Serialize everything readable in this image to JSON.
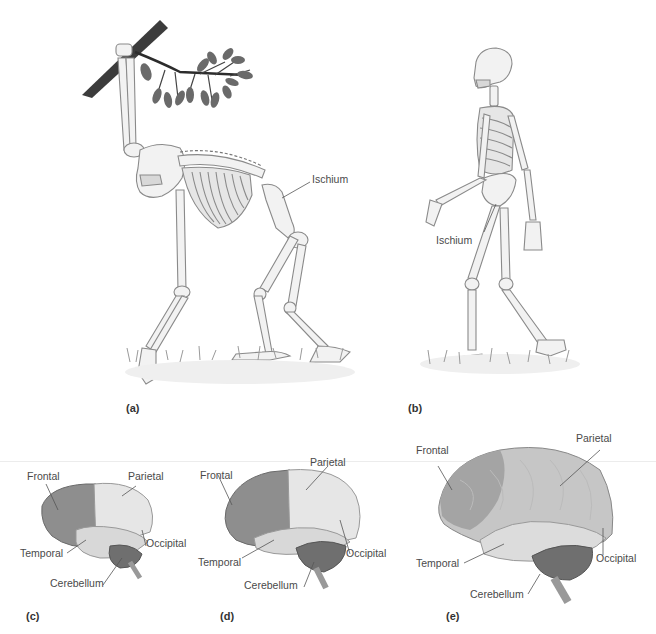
{
  "figure": {
    "panels": [
      {
        "id": "a",
        "caption": "(a)",
        "subject": "ape skeleton (quadrupedal, hanging from branch)",
        "labels": {
          "ischium": "Ischium"
        }
      },
      {
        "id": "b",
        "caption": "(b)",
        "subject": "human skeleton (bipedal walking)",
        "labels": {
          "ischium": "Ischium"
        }
      },
      {
        "id": "c",
        "caption": "(c)",
        "subject": "small brain",
        "labels": {
          "frontal": "Frontal",
          "parietal": "Parietal",
          "temporal": "Temporal",
          "occipital": "Occipital",
          "cerebellum": "Cerebellum"
        }
      },
      {
        "id": "d",
        "caption": "(d)",
        "subject": "medium brain",
        "labels": {
          "frontal": "Frontal",
          "parietal": "Parietal",
          "temporal": "Temporal",
          "occipital": "Occipital",
          "cerebellum": "Cerebellum"
        }
      },
      {
        "id": "e",
        "caption": "(e)",
        "subject": "large brain",
        "labels": {
          "frontal": "Frontal",
          "parietal": "Parietal",
          "temporal": "Temporal",
          "occipital": "Occipital",
          "cerebellum": "Cerebellum"
        }
      }
    ],
    "colors": {
      "background": "#ffffff",
      "bone_fill": "#f2f2f2",
      "bone_stroke": "#8a8a8a",
      "branch": "#3c3c3c",
      "leaf": "#6a6a6a",
      "grass": "#9a9a9a",
      "brain_dark": "#8e8e8e",
      "brain_light": "#e6e6e6",
      "cerebellum": "#6f6f6f",
      "label_text": "#4a4a4a",
      "leader_line": "#555555"
    }
  }
}
